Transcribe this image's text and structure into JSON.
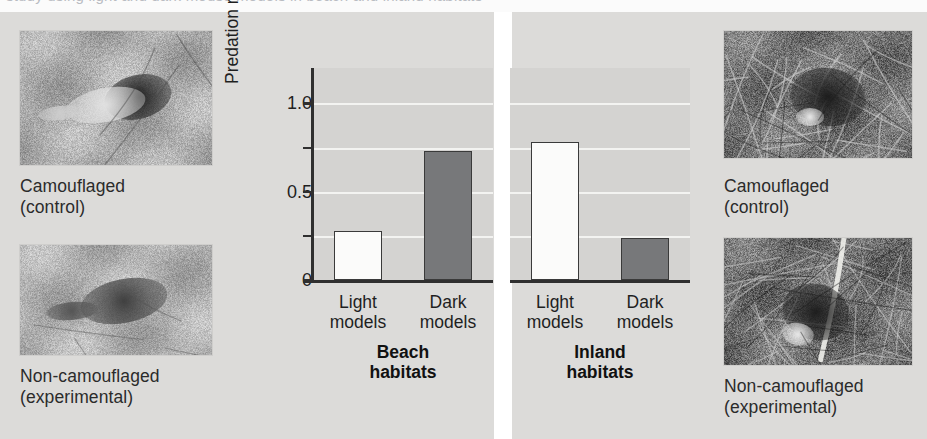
{
  "figure": {
    "background_color": "#dcdbd9",
    "top_cropped_text": "study using light and dark mouse models in beach and inland habitats"
  },
  "left_column": {
    "panels": [
      {
        "photo_name": "beach-mouse-camouflaged-photo",
        "caption": "Camouflaged\n(control)"
      },
      {
        "photo_name": "beach-mouse-non-camouflaged-photo",
        "caption": "Non-camouflaged\n(experimental)"
      }
    ]
  },
  "right_column": {
    "panels": [
      {
        "photo_name": "inland-mouse-camouflaged-photo",
        "caption": "Camouflaged\n(control)"
      },
      {
        "photo_name": "inland-mouse-non-camouflaged-photo",
        "caption": "Non-camouflaged\n(experimental)"
      }
    ]
  },
  "chart_data": {
    "type": "bar",
    "title": "",
    "xlabel": "",
    "ylabel": "Predation rate",
    "ylim": [
      0,
      1.2
    ],
    "yticks": [
      0,
      0.25,
      0.5,
      0.75,
      1.0
    ],
    "ytick_labels": [
      "0",
      "",
      "0.5",
      "",
      "1.0"
    ],
    "grid": true,
    "gridlines_at": [
      0.25,
      0.5,
      0.75,
      1.0
    ],
    "legend": "none",
    "panels": [
      {
        "name": "Beach\nhabitats",
        "title_line1": "Beach",
        "title_line2": "habitats",
        "categories": [
          "Light\nmodels",
          "Dark\nmodels"
        ],
        "bars": [
          {
            "label": "Light models",
            "value": 0.28,
            "fill": "#fbfbfa",
            "style": "light"
          },
          {
            "label": "Dark models",
            "value": 0.73,
            "fill": "#77787a",
            "style": "dark"
          }
        ]
      },
      {
        "name": "Inland\nhabitats",
        "title_line1": "Inland",
        "title_line2": "habitats",
        "categories": [
          "Light\nmodels",
          "Dark\nmodels"
        ],
        "bars": [
          {
            "label": "Light models",
            "value": 0.78,
            "fill": "#fbfbfa",
            "style": "light"
          },
          {
            "label": "Dark models",
            "value": 0.24,
            "fill": "#77787a",
            "style": "dark"
          }
        ]
      }
    ]
  }
}
